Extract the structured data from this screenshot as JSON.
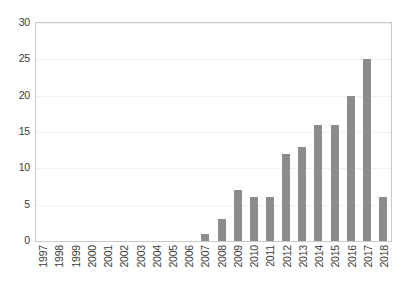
{
  "chart_data": {
    "type": "bar",
    "title": "",
    "subtitle": "",
    "xlabel": "",
    "ylabel": "",
    "categories": [
      "1997",
      "1998",
      "1999",
      "2000",
      "2001",
      "2002",
      "2003",
      "2004",
      "2005",
      "2006",
      "2007",
      "2008",
      "2009",
      "2010",
      "2011",
      "2012",
      "2013",
      "2014",
      "2015",
      "2016",
      "2017",
      "2018"
    ],
    "values": [
      0,
      0,
      0,
      0,
      0,
      0,
      0,
      0,
      0,
      0,
      1,
      3,
      7,
      6,
      6,
      12,
      13,
      16,
      16,
      20,
      25,
      6
    ],
    "ylim": [
      0,
      30
    ],
    "y_ticks": [
      "0",
      "5",
      "10",
      "15",
      "20",
      "25",
      "30"
    ],
    "y_tick_values": [
      0,
      5,
      10,
      15,
      20,
      25,
      30
    ],
    "grid": "horizontal",
    "legend": "none",
    "bar_color": "#8c8c8c",
    "plot_border_color": "#c9c9c9",
    "gridline_color": "#f0f0f0",
    "background_color": "#ffffff",
    "tick_label_color": "#3a3a3a",
    "x_label_rotation": "90",
    "annotations": []
  }
}
